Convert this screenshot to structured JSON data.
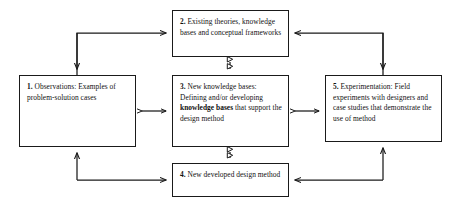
{
  "diagram": {
    "type": "flow-diagram",
    "background_color": "#ffffff",
    "line_color": "#1a1a1a",
    "nodes": [
      {
        "id": "node1",
        "number": "1.",
        "heading": " Observations:",
        "body": "Examples of problem-solution cases",
        "emphasis": ""
      },
      {
        "id": "node2",
        "number": "2.",
        "heading": " Existing theories,",
        "body": "knowledge bases and conceptual frameworks",
        "emphasis": ""
      },
      {
        "id": "node3",
        "number": "3.",
        "heading": " New knowledge bases:",
        "body_before": "Defining and/or developing ",
        "emphasis": "knowledge bases",
        "body_after": " that support the design method"
      },
      {
        "id": "node4",
        "number": "4.",
        "heading": " New developed design",
        "body": "method",
        "emphasis": ""
      },
      {
        "id": "node5",
        "number": "5.",
        "heading": " Experimentation:",
        "body": "Field experiments with designers and case studies that demonstrate the use of method",
        "emphasis": ""
      }
    ],
    "connectors": [
      {
        "name": "node1-to-node2",
        "style": "elbow",
        "arrowheads": "both-ends-single",
        "label": ""
      },
      {
        "name": "node5-to-node2",
        "style": "elbow",
        "arrowheads": "both-ends-single",
        "label": ""
      },
      {
        "name": "node2-to-node3",
        "style": "straight-vertical",
        "arrowheads": "double",
        "label": ""
      },
      {
        "name": "node1-to-node3",
        "style": "straight-horizontal",
        "arrowheads": "double",
        "label": ""
      },
      {
        "name": "node3-to-node5",
        "style": "straight-horizontal",
        "arrowheads": "double",
        "label": ""
      },
      {
        "name": "node3-to-node4",
        "style": "straight-vertical",
        "arrowheads": "double",
        "label": ""
      },
      {
        "name": "node1-to-node4",
        "style": "elbow",
        "arrowheads": "both-ends-single",
        "label": ""
      },
      {
        "name": "node5-to-node4",
        "style": "elbow",
        "arrowheads": "both-ends-single",
        "label": ""
      }
    ]
  }
}
